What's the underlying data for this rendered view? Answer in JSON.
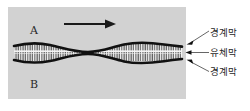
{
  "figure": {
    "panel": {
      "background_color": "#d2d2d2",
      "regions": [
        {
          "id": "region-a",
          "label": "A",
          "position": "upper"
        },
        {
          "id": "region-b",
          "label": "B",
          "position": "lower"
        }
      ],
      "flow_arrow": {
        "icon": "arrow-right-icon",
        "direction": "right",
        "color": "#1a1a1a"
      },
      "layers": [
        {
          "id": "upper-boundary",
          "name": "upper-boundary-film",
          "color": "#111111"
        },
        {
          "id": "fluid-film",
          "name": "fluid-film",
          "color": "#f2f2f2"
        },
        {
          "id": "lower-boundary",
          "name": "lower-boundary-film",
          "color": "#111111"
        }
      ]
    },
    "callouts": [
      {
        "id": "callout-top",
        "label": "경계막",
        "target": "upper-boundary-film",
        "leader": {
          "from_x": 188,
          "from_y": 42,
          "to_x": 208,
          "to_y": 31
        },
        "arrowhead": "left"
      },
      {
        "id": "callout-middle",
        "label": "유체막",
        "target": "fluid-film",
        "leader": {
          "from_x": 188,
          "from_y": 52,
          "to_x": 208,
          "to_y": 52
        },
        "arrowhead": "left"
      },
      {
        "id": "callout-bottom",
        "label": "경계막",
        "target": "lower-boundary-film",
        "leader": {
          "from_x": 188,
          "from_y": 63,
          "to_x": 208,
          "to_y": 70
        },
        "arrowhead": "left"
      }
    ],
    "colors": {
      "panel": "#d2d2d2",
      "ink": "#1a1a1a",
      "film": "#f2f2f2",
      "page": "#ffffff"
    }
  }
}
